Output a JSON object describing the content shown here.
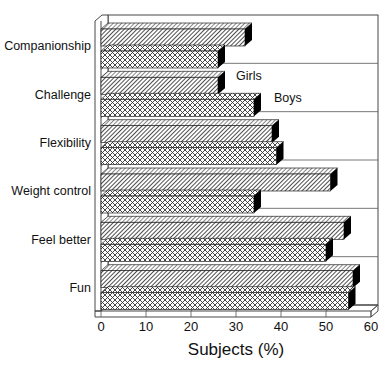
{
  "chart_data": {
    "type": "bar",
    "orientation": "horizontal",
    "style": "3d",
    "title": "",
    "xlabel": "Subjects (%)",
    "ylabel": "",
    "xlim": [
      0,
      60
    ],
    "xticks": [
      0,
      10,
      20,
      30,
      40,
      50,
      60
    ],
    "grid": true,
    "categories": [
      "Companionship",
      "Challenge",
      "Flexibility",
      "Weight control",
      "Feel better",
      "Fun"
    ],
    "series": [
      {
        "name": "Girls",
        "pattern": "diagonal-hatch",
        "values": [
          32,
          26,
          38,
          51,
          54,
          56
        ]
      },
      {
        "name": "Boys",
        "pattern": "cross-hatch",
        "values": [
          26,
          34,
          39,
          34,
          50,
          55
        ]
      }
    ],
    "legend": {
      "position": "inline-annotation",
      "anchor_category": "Challenge"
    }
  },
  "labels": {
    "girls": "Girls",
    "boys": "Boys",
    "axis_title": "Subjects (%)"
  }
}
